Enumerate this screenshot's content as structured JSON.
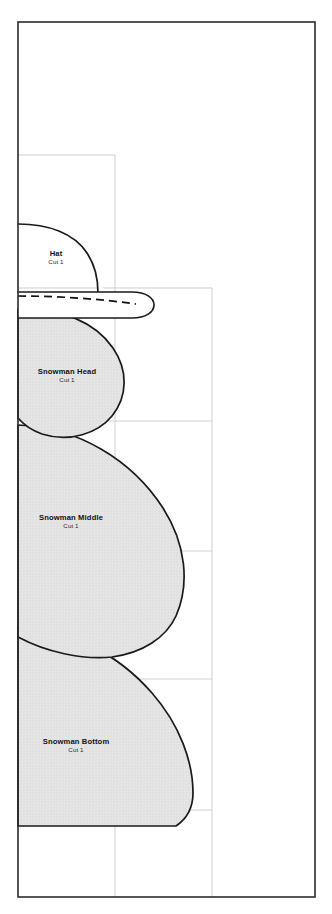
{
  "document": {
    "kind": "sewing-pattern-sheet",
    "background_color": "#ffffff"
  },
  "colors": {
    "page_border": "#2b2b2b",
    "tile_guide": "#c9c9c9",
    "piece_outline": "#1a1a1a",
    "piece_fill": "#e3e3e3",
    "label_text": "#111111"
  },
  "page_border": {
    "x": 18,
    "y": 22,
    "width": 297,
    "height": 875
  },
  "tile_guides": {
    "vertical_x": [
      115,
      212
    ],
    "horizontal_y": [
      155,
      288,
      421,
      551,
      679,
      810
    ],
    "overlap_rects": [
      {
        "x": 18,
        "y": 155,
        "width": 97,
        "height": 133
      },
      {
        "x": 18,
        "y": 288,
        "width": 194,
        "height": 263
      }
    ]
  },
  "pieces": [
    {
      "id": "hat",
      "title": "Hat",
      "cut": "Cut 1",
      "filled": false,
      "label_x": 56,
      "label_y": 252,
      "has_dashed_fold_line": true
    },
    {
      "id": "snowman-head",
      "title": "Snowman Head",
      "cut": "Cut 1",
      "filled": true,
      "label_x": 69,
      "label_y": 370
    },
    {
      "id": "snowman-middle",
      "title": "Snowman Middle",
      "cut": "Cut 1",
      "filled": true,
      "label_x": 69,
      "label_y": 516
    },
    {
      "id": "snowman-bottom",
      "title": "Snowman Bottom",
      "cut": "Cut 1",
      "filled": true,
      "label_x": 73,
      "label_y": 739
    }
  ]
}
